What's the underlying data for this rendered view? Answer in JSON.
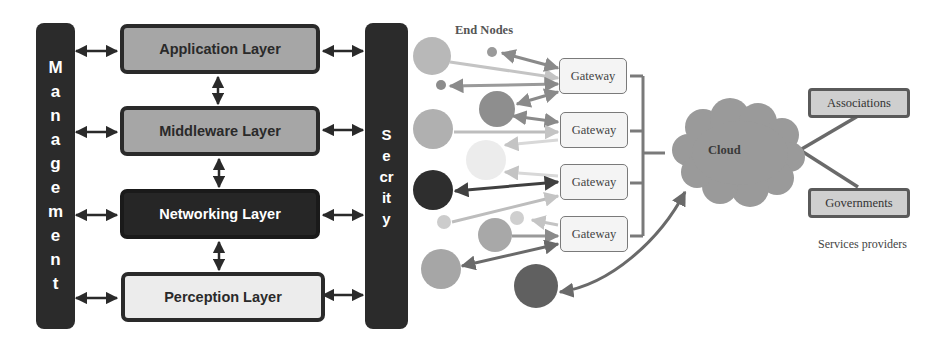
{
  "architecture": {
    "management_bar": {
      "label": "Management",
      "letters": [
        "M",
        "a",
        "n",
        "a",
        "g",
        "e",
        "m",
        "e",
        "n",
        "t"
      ]
    },
    "security_bar": {
      "label": "Secrity",
      "letters": [
        "S",
        "e",
        "cr",
        "it",
        "y"
      ]
    },
    "layers": [
      {
        "label": "Application Layer",
        "fill": "#a6a6a6",
        "text_color": "#2a2a2a"
      },
      {
        "label": "Middleware Layer",
        "fill": "#a6a6a6",
        "text_color": "#2a2a2a"
      },
      {
        "label": "Networking Layer",
        "fill": "#262626",
        "text_color": "#ffffff"
      },
      {
        "label": "Perception Layer",
        "fill": "#ececec",
        "text_color": "#2a2a2a"
      }
    ]
  },
  "network": {
    "end_nodes_label": "End Nodes",
    "gateways": [
      {
        "label": "Gateway"
      },
      {
        "label": "Gateway"
      },
      {
        "label": "Gateway"
      },
      {
        "label": "Gateway"
      }
    ],
    "cloud_label": "Cloud",
    "service_providers": [
      {
        "label": "Associations"
      },
      {
        "label": "Governments"
      }
    ],
    "service_providers_label": "Services providers"
  }
}
